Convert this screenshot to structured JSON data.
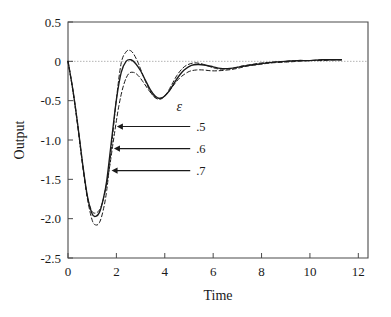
{
  "chart_data": {
    "type": "line",
    "title": "",
    "xlabel": "Time",
    "ylabel": "Output",
    "xlim": [
      0,
      12.4
    ],
    "ylim": [
      -2.5,
      0.5
    ],
    "xticks": [
      0,
      2,
      4,
      6,
      8,
      10,
      12
    ],
    "xtick_labels": [
      "0",
      "2",
      "4",
      "6",
      "8",
      "10",
      "12"
    ],
    "yticks": [
      0.5,
      0,
      -0.5,
      -1.0,
      -1.5,
      -2.0,
      -2.5
    ],
    "ytick_labels": [
      "0.5",
      "0",
      "-0.5",
      "-1.0",
      "-1.5",
      "-2.0",
      "-2.5"
    ],
    "grid": false,
    "legend": "annotated-arrows",
    "zero_reference_line": {
      "y": 0,
      "style": "dotted",
      "color": "#b4b4b4"
    },
    "series": [
      {
        "name": ".5",
        "parameter": "epsilon",
        "value": 0.5,
        "style": "dashed",
        "color": "#1a1a1a",
        "x": [
          0,
          0.2,
          0.4,
          0.6,
          0.8,
          1.0,
          1.15,
          1.3,
          1.45,
          1.6,
          1.8,
          2.0,
          2.2,
          2.4,
          2.55,
          2.7,
          2.9,
          3.1,
          3.3,
          3.5,
          3.7,
          3.9,
          4.1,
          4.3,
          4.5,
          4.7,
          4.9,
          5.2,
          5.5,
          5.8,
          6.1,
          6.4,
          6.8,
          7.2,
          7.6,
          8.0,
          8.5,
          9.0,
          9.5,
          10.0,
          10.5,
          11.0,
          11.3
        ],
        "y": [
          0,
          -0.36,
          -0.8,
          -1.3,
          -1.74,
          -2.02,
          -2.08,
          -2.05,
          -1.9,
          -1.64,
          -1.08,
          -0.48,
          -0.02,
          0.12,
          0.14,
          0.1,
          -0.02,
          -0.18,
          -0.32,
          -0.43,
          -0.48,
          -0.47,
          -0.4,
          -0.29,
          -0.18,
          -0.1,
          -0.05,
          -0.02,
          -0.03,
          -0.06,
          -0.09,
          -0.1,
          -0.09,
          -0.06,
          -0.04,
          -0.02,
          -0.01,
          0.0,
          0.01,
          0.01,
          0.02,
          0.02,
          0.02
        ]
      },
      {
        "name": ".6",
        "parameter": "epsilon",
        "value": 0.6,
        "style": "solid",
        "color": "#1a1a1a",
        "x": [
          0,
          0.2,
          0.4,
          0.6,
          0.8,
          1.0,
          1.15,
          1.3,
          1.45,
          1.6,
          1.8,
          2.0,
          2.2,
          2.4,
          2.6,
          2.8,
          3.0,
          3.2,
          3.4,
          3.6,
          3.8,
          4.0,
          4.2,
          4.4,
          4.6,
          4.8,
          5.1,
          5.4,
          5.7,
          6.0,
          6.3,
          6.7,
          7.1,
          7.5,
          8.0,
          8.5,
          9.0,
          9.5,
          10.0,
          10.5,
          11.0,
          11.3
        ],
        "y": [
          0,
          -0.36,
          -0.8,
          -1.29,
          -1.71,
          -1.94,
          -1.97,
          -1.92,
          -1.76,
          -1.52,
          -1.0,
          -0.49,
          -0.14,
          0.0,
          0.02,
          -0.03,
          -0.12,
          -0.24,
          -0.36,
          -0.44,
          -0.47,
          -0.44,
          -0.37,
          -0.27,
          -0.18,
          -0.11,
          -0.05,
          -0.04,
          -0.05,
          -0.07,
          -0.09,
          -0.09,
          -0.07,
          -0.05,
          -0.03,
          -0.01,
          0.0,
          0.01,
          0.01,
          0.02,
          0.02,
          0.02
        ]
      },
      {
        "name": ".7",
        "parameter": "epsilon",
        "value": 0.7,
        "style": "dashed",
        "color": "#1a1a1a",
        "x": [
          0,
          0.2,
          0.4,
          0.6,
          0.8,
          1.0,
          1.2,
          1.35,
          1.5,
          1.7,
          1.9,
          2.1,
          2.3,
          2.5,
          2.7,
          2.9,
          3.1,
          3.3,
          3.5,
          3.7,
          3.9,
          4.1,
          4.3,
          4.5,
          4.7,
          5.0,
          5.3,
          5.6,
          5.9,
          6.2,
          6.6,
          7.0,
          7.4,
          7.9,
          8.4,
          9.0,
          9.5,
          10.0,
          10.5,
          11.0,
          11.3
        ],
        "y": [
          0,
          -0.37,
          -0.82,
          -1.31,
          -1.72,
          -1.91,
          -1.92,
          -1.86,
          -1.7,
          -1.38,
          -0.96,
          -0.57,
          -0.3,
          -0.16,
          -0.14,
          -0.18,
          -0.26,
          -0.35,
          -0.43,
          -0.47,
          -0.46,
          -0.41,
          -0.33,
          -0.25,
          -0.19,
          -0.13,
          -0.11,
          -0.11,
          -0.12,
          -0.12,
          -0.11,
          -0.09,
          -0.06,
          -0.04,
          -0.02,
          -0.01,
          0.0,
          0.01,
          0.01,
          0.02,
          0.02
        ]
      }
    ],
    "annotations": [
      {
        "text": "ε",
        "type": "parameter-symbol",
        "x": 4.6,
        "y": -0.63
      },
      {
        "text": ".5",
        "type": "series-callout",
        "x": 5.3,
        "y": -0.88,
        "arrow_to_x": 2.02,
        "arrow_to_y": -0.88
      },
      {
        "text": ".6",
        "type": "series-callout",
        "x": 5.3,
        "y": -1.16,
        "arrow_to_x": 1.9,
        "arrow_to_y": -1.16
      },
      {
        "text": ".7",
        "type": "series-callout",
        "x": 5.3,
        "y": -1.44,
        "arrow_to_x": 1.8,
        "arrow_to_y": -1.44
      }
    ]
  },
  "axes": {
    "y_title": "Output",
    "x_title": "Time"
  }
}
